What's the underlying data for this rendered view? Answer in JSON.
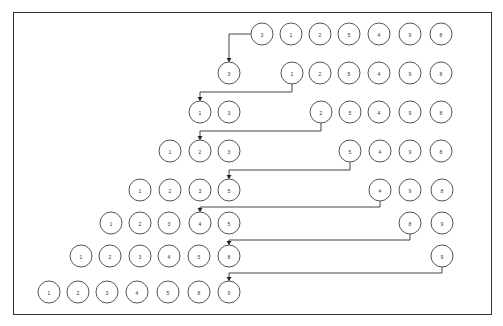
{
  "diagram": {
    "type": "insertion-sort-steps",
    "colors": {
      "frame": "#333333",
      "circle_stroke": "#555555",
      "connector": "#444444",
      "text": "#333333"
    },
    "node_radius": 11,
    "rows": [
      {
        "y": 34,
        "nodes": [
          {
            "v": "3",
            "x": 262
          },
          {
            "v": "1",
            "x": 291
          },
          {
            "v": "2",
            "x": 320
          },
          {
            "v": "5",
            "x": 349
          },
          {
            "v": "4",
            "x": 379
          },
          {
            "v": "9",
            "x": 410
          },
          {
            "v": "8",
            "x": 441
          }
        ]
      },
      {
        "y": 73,
        "nodes": [
          {
            "v": "3",
            "x": 229
          },
          {
            "v": "1",
            "x": 292
          },
          {
            "v": "2",
            "x": 320
          },
          {
            "v": "5",
            "x": 349
          },
          {
            "v": "4",
            "x": 379
          },
          {
            "v": "9",
            "x": 410
          },
          {
            "v": "8",
            "x": 441
          }
        ]
      },
      {
        "y": 112,
        "nodes": [
          {
            "v": "1",
            "x": 200
          },
          {
            "v": "3",
            "x": 229
          },
          {
            "v": "2",
            "x": 321
          },
          {
            "v": "5",
            "x": 350
          },
          {
            "v": "4",
            "x": 379
          },
          {
            "v": "9",
            "x": 410
          },
          {
            "v": "8",
            "x": 441
          }
        ]
      },
      {
        "y": 151,
        "nodes": [
          {
            "v": "1",
            "x": 170
          },
          {
            "v": "2",
            "x": 200
          },
          {
            "v": "3",
            "x": 229
          },
          {
            "v": "5",
            "x": 350
          },
          {
            "v": "4",
            "x": 380
          },
          {
            "v": "9",
            "x": 410
          },
          {
            "v": "8",
            "x": 441
          }
        ]
      },
      {
        "y": 190,
        "nodes": [
          {
            "v": "1",
            "x": 140
          },
          {
            "v": "2",
            "x": 170
          },
          {
            "v": "3",
            "x": 200
          },
          {
            "v": "5",
            "x": 229
          },
          {
            "v": "4",
            "x": 380
          },
          {
            "v": "9",
            "x": 410
          },
          {
            "v": "8",
            "x": 442
          }
        ]
      },
      {
        "y": 223,
        "nodes": [
          {
            "v": "1",
            "x": 111
          },
          {
            "v": "2",
            "x": 140
          },
          {
            "v": "3",
            "x": 169
          },
          {
            "v": "4",
            "x": 200
          },
          {
            "v": "5",
            "x": 229
          },
          {
            "v": "8",
            "x": 410
          },
          {
            "v": "9",
            "x": 442
          }
        ]
      },
      {
        "y": 256,
        "nodes": [
          {
            "v": "1",
            "x": 81
          },
          {
            "v": "2",
            "x": 110
          },
          {
            "v": "3",
            "x": 140
          },
          {
            "v": "4",
            "x": 169
          },
          {
            "v": "5",
            "x": 199
          },
          {
            "v": "8",
            "x": 229
          },
          {
            "v": "9",
            "x": 442
          }
        ]
      },
      {
        "y": 292,
        "nodes": [
          {
            "v": "1",
            "x": 49
          },
          {
            "v": "2",
            "x": 78
          },
          {
            "v": "3",
            "x": 107
          },
          {
            "v": "4",
            "x": 137
          },
          {
            "v": "5",
            "x": 168
          },
          {
            "v": "8",
            "x": 199
          },
          {
            "v": "9",
            "x": 229
          }
        ]
      }
    ],
    "connectors": [
      {
        "from": "3",
        "points": [
          [
            251,
            34
          ],
          [
            229,
            34
          ],
          [
            229,
            62
          ]
        ]
      },
      {
        "from": "1",
        "points": [
          [
            292,
            84
          ],
          [
            292,
            92
          ],
          [
            200,
            92
          ],
          [
            200,
            101
          ]
        ]
      },
      {
        "from": "2",
        "points": [
          [
            321,
            123
          ],
          [
            321,
            131
          ],
          [
            200,
            131
          ],
          [
            200,
            140
          ]
        ]
      },
      {
        "from": "5",
        "points": [
          [
            350,
            162
          ],
          [
            350,
            170
          ],
          [
            229,
            170
          ],
          [
            229,
            179
          ]
        ]
      },
      {
        "from": "4",
        "points": [
          [
            380,
            201
          ],
          [
            380,
            207
          ],
          [
            200,
            207
          ],
          [
            200,
            212
          ]
        ]
      },
      {
        "from": "8",
        "points": [
          [
            410,
            234
          ],
          [
            410,
            240
          ],
          [
            229,
            240
          ],
          [
            229,
            245
          ]
        ]
      },
      {
        "from": "9",
        "points": [
          [
            442,
            267
          ],
          [
            442,
            273
          ],
          [
            229,
            273
          ],
          [
            229,
            281
          ]
        ]
      }
    ]
  }
}
